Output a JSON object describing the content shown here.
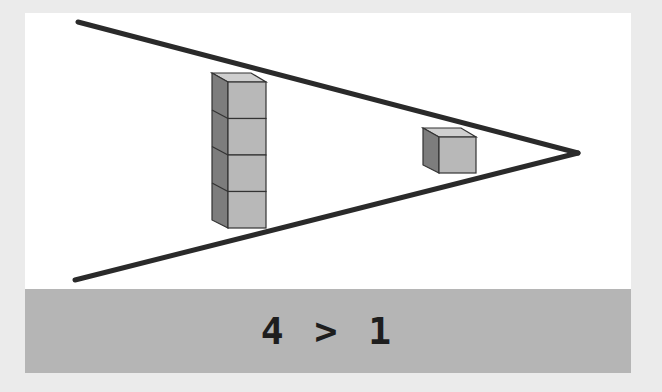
{
  "diagram": {
    "left_group": {
      "label": "stack of cubes",
      "count": 4
    },
    "right_group": {
      "label": "single cube",
      "count": 1
    },
    "comparison_symbol": ">",
    "colors": {
      "background": "#ebebeb",
      "card": "#ffffff",
      "band": "#b5b5b5",
      "lines": "#2a2a2a",
      "cube_front": "#b8b8b8",
      "cube_side": "#7d7d7d",
      "cube_top": "#cfcfcf"
    }
  },
  "caption": {
    "text": "4 > 1"
  }
}
